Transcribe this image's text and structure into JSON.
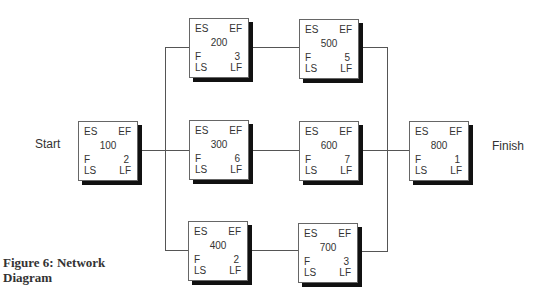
{
  "diagram": {
    "start_label": "Start",
    "finish_label": "Finish",
    "caption": "Figure 6: Network Diagram",
    "field_labels": {
      "es": "ES",
      "ef": "EF",
      "f": "F",
      "ls": "LS",
      "lf": "LF"
    },
    "nodes": {
      "n100": {
        "id": "100",
        "f": "2"
      },
      "n200": {
        "id": "200",
        "f": "3"
      },
      "n300": {
        "id": "300",
        "f": "6"
      },
      "n400": {
        "id": "400",
        "f": "2"
      },
      "n500": {
        "id": "500",
        "f": "5"
      },
      "n600": {
        "id": "600",
        "f": "7"
      },
      "n700": {
        "id": "700",
        "f": "3"
      },
      "n800": {
        "id": "800",
        "f": "1"
      }
    },
    "edges": [
      [
        "Start",
        "100"
      ],
      [
        "100",
        "200"
      ],
      [
        "100",
        "300"
      ],
      [
        "100",
        "400"
      ],
      [
        "200",
        "500"
      ],
      [
        "300",
        "600"
      ],
      [
        "400",
        "700"
      ],
      [
        "500",
        "800"
      ],
      [
        "600",
        "800"
      ],
      [
        "700",
        "800"
      ],
      [
        "800",
        "Finish"
      ]
    ]
  }
}
